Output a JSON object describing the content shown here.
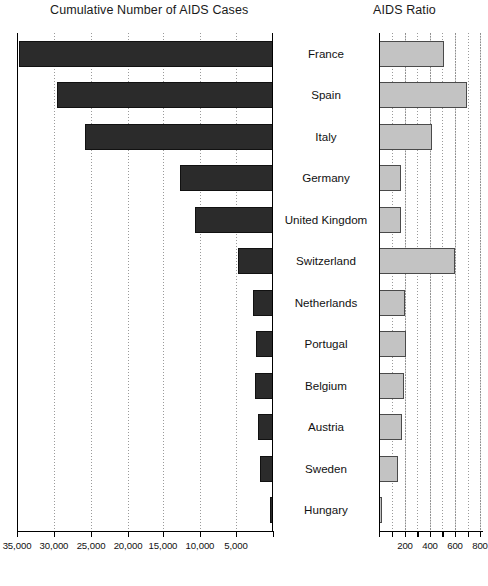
{
  "titles": {
    "left": "Cumulative Number of AIDS Cases",
    "right": "AIDS Ratio"
  },
  "chart_data": [
    {
      "type": "bar",
      "orientation": "horizontal",
      "title": "Cumulative Number of AIDS Cases",
      "xlabel": "",
      "ylabel": "",
      "axis_reversed": true,
      "xlim": [
        0,
        37000
      ],
      "grid": true,
      "tick_labels": [
        "35,000",
        "30,000",
        "25,000",
        "20,000",
        "15,000",
        "10,000",
        "5,000"
      ],
      "tick_values": [
        35000,
        30000,
        25000,
        20000,
        15000,
        10000,
        5000
      ],
      "categories": [
        "France",
        "Spain",
        "Italy",
        "Germany",
        "United Kingdom",
        "Switzerland",
        "Netherlands",
        "Portugal",
        "Belgium",
        "Austria",
        "Sweden",
        "Hungary"
      ],
      "values": [
        34500,
        29500,
        25700,
        12600,
        10500,
        4700,
        2600,
        2200,
        2300,
        1900,
        1650,
        250
      ],
      "bar_color": "#2b2b2b"
    },
    {
      "type": "bar",
      "orientation": "horizontal",
      "title": "AIDS Ratio",
      "xlabel": "",
      "ylabel": "",
      "axis_reversed": false,
      "xlim": [
        0,
        820
      ],
      "grid": true,
      "tick_labels": [
        "200",
        "400",
        "600",
        "800"
      ],
      "tick_values": [
        200,
        400,
        600,
        800
      ],
      "categories": [
        "France",
        "Spain",
        "Italy",
        "Germany",
        "United Kingdom",
        "Switzerland",
        "Netherlands",
        "Portugal",
        "Belgium",
        "Austria",
        "Sweden",
        "Hungary"
      ],
      "values": [
        510,
        690,
        420,
        175,
        170,
        600,
        205,
        215,
        195,
        180,
        150,
        25
      ],
      "bar_color": "#c3c3c3"
    }
  ],
  "left_chart": {
    "ticks": [
      {
        "label": "35,000",
        "pos_pct": 0
      },
      {
        "label": "30,000",
        "pos_pct": 14.45
      },
      {
        "label": "25,000",
        "pos_pct": 28.91
      },
      {
        "label": "20,000",
        "pos_pct": 43.36
      },
      {
        "label": "15,000",
        "pos_pct": 57.03
      },
      {
        "label": "10,000",
        "pos_pct": 71.48
      },
      {
        "label": "5,000",
        "pos_pct": 85.55
      }
    ],
    "bars": [
      {
        "country": "France",
        "value": 34500,
        "start_pct": 0.78,
        "width_pct": 99.22
      },
      {
        "country": "Spain",
        "value": 29500,
        "start_pct": 15.63,
        "width_pct": 84.37
      },
      {
        "country": "Italy",
        "value": 25700,
        "start_pct": 26.56,
        "width_pct": 73.44
      },
      {
        "country": "Germany",
        "value": 12600,
        "start_pct": 63.67,
        "width_pct": 36.33
      },
      {
        "country": "United Kingdom",
        "value": 10500,
        "start_pct": 69.53,
        "width_pct": 30.47
      },
      {
        "country": "Switzerland",
        "value": 4700,
        "start_pct": 86.33,
        "width_pct": 13.67
      },
      {
        "country": "Netherlands",
        "value": 2600,
        "start_pct": 92.19,
        "width_pct": 7.81
      },
      {
        "country": "Portugal",
        "value": 2200,
        "start_pct": 93.36,
        "width_pct": 6.64
      },
      {
        "country": "Belgium",
        "value": 2300,
        "start_pct": 92.97,
        "width_pct": 7.03
      },
      {
        "country": "Austria",
        "value": 1900,
        "start_pct": 94.14,
        "width_pct": 5.86
      },
      {
        "country": "Sweden",
        "value": 1650,
        "start_pct": 94.92,
        "width_pct": 5.08
      },
      {
        "country": "Hungary",
        "value": 250,
        "start_pct": 98.83,
        "width_pct": 1.17
      }
    ]
  },
  "right_chart": {
    "ticks": [
      {
        "label": "200",
        "pos_pct": 25.0
      },
      {
        "label": "400",
        "pos_pct": 49.04
      },
      {
        "label": "600",
        "pos_pct": 73.08
      },
      {
        "label": "800",
        "pos_pct": 97.12
      }
    ],
    "minor_ticks_pct": [
      12.5,
      37.0,
      61.0,
      85.1
    ],
    "bars": [
      {
        "country": "France",
        "value": 510,
        "width_pct": 62.5
      },
      {
        "country": "Spain",
        "value": 690,
        "width_pct": 84.6
      },
      {
        "country": "Italy",
        "value": 420,
        "width_pct": 51.4
      },
      {
        "country": "Germany",
        "value": 175,
        "width_pct": 21.6
      },
      {
        "country": "United Kingdom",
        "value": 170,
        "width_pct": 21.0
      },
      {
        "country": "Switzerland",
        "value": 600,
        "width_pct": 73.5
      },
      {
        "country": "Netherlands",
        "value": 205,
        "width_pct": 25.2
      },
      {
        "country": "Portugal",
        "value": 215,
        "width_pct": 26.4
      },
      {
        "country": "Belgium",
        "value": 195,
        "width_pct": 23.9
      },
      {
        "country": "Austria",
        "value": 180,
        "width_pct": 22.2
      },
      {
        "country": "Sweden",
        "value": 150,
        "width_pct": 18.4
      },
      {
        "country": "Hungary",
        "value": 25,
        "width_pct": 3.0
      }
    ]
  },
  "countries": [
    "France",
    "Spain",
    "Italy",
    "Germany",
    "United Kingdom",
    "Switzerland",
    "Netherlands",
    "Portugal",
    "Belgium",
    "Austria",
    "Sweden",
    "Hungary"
  ],
  "colors": {
    "left_bar": "#2b2b2b",
    "right_bar": "#c3c3c3",
    "axis": "#000000",
    "grid": "#9a9a9a",
    "text": "#111111",
    "background": "#ffffff"
  }
}
